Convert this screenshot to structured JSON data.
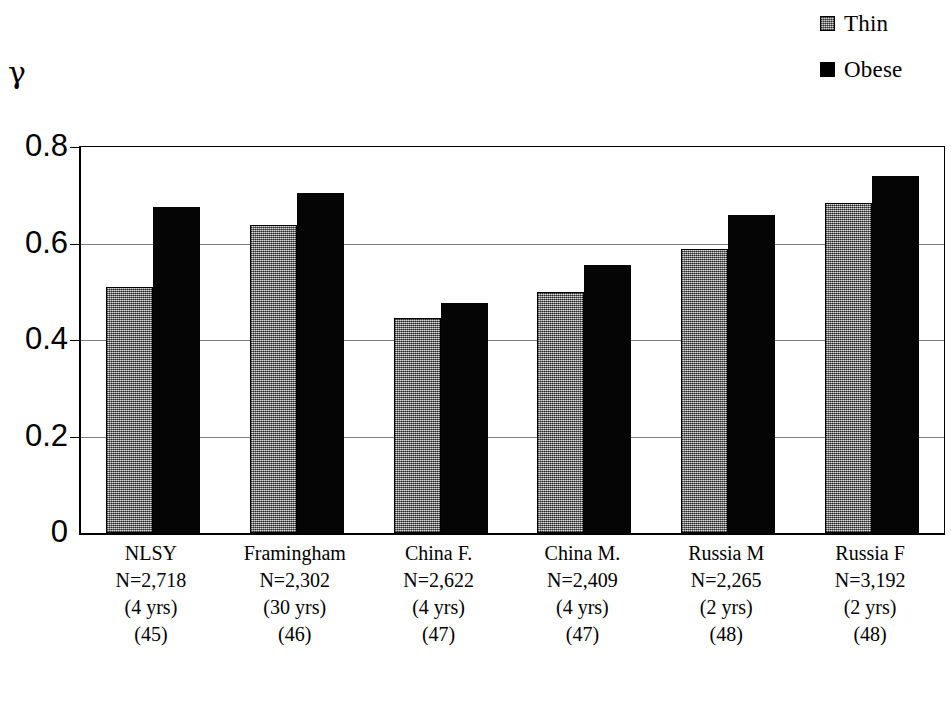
{
  "chart_data": {
    "type": "bar",
    "title": "",
    "xlabel": "",
    "ylabel": "γ",
    "ylim": [
      0,
      0.8
    ],
    "yticks": [
      "0.8",
      "0.6",
      "0.4",
      "0.2",
      "0"
    ],
    "ytick_values": [
      0.8,
      0.6,
      0.4,
      0.2,
      0
    ],
    "grid": true,
    "legend_position": "top-right",
    "categories": [
      "NLSY",
      "Framingham",
      "China F.",
      "China M.",
      "Russia M",
      "Russia F"
    ],
    "category_details": [
      {
        "name": "NLSY",
        "n": "N=2,718",
        "years": "(4 yrs)",
        "ref": "(45)"
      },
      {
        "name": "Framingham",
        "n": "N=2,302",
        "years": "(30 yrs)",
        "ref": "(46)"
      },
      {
        "name": "China F.",
        "n": "N=2,622",
        "years": "(4 yrs)",
        "ref": "(47)"
      },
      {
        "name": "China M.",
        "n": "N=2,409",
        "years": "(4 yrs)",
        "ref": "(47)"
      },
      {
        "name": "Russia M",
        "n": "N=2,265",
        "years": "(2 yrs)",
        "ref": "(48)"
      },
      {
        "name": "Russia F",
        "n": "N=3,192",
        "years": "(2 yrs)",
        "ref": "(48)"
      }
    ],
    "series": [
      {
        "name": "Thin",
        "color": "#8f8f8f",
        "values": [
          0.51,
          0.638,
          0.445,
          0.5,
          0.588,
          0.685
        ]
      },
      {
        "name": "Obese",
        "color": "#000000",
        "values": [
          0.675,
          0.705,
          0.477,
          0.555,
          0.66,
          0.74
        ]
      }
    ]
  },
  "legend": {
    "items": [
      {
        "label": "Thin",
        "swatch": "thin-swatch"
      },
      {
        "label": "Obese",
        "swatch": "obese-swatch"
      }
    ]
  }
}
